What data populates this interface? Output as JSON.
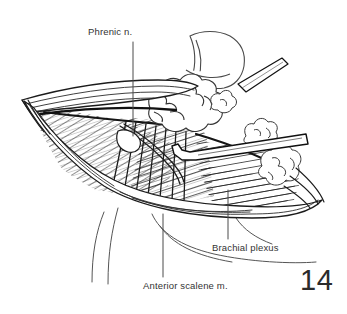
{
  "figure": {
    "number": "14",
    "kind": "anatomical-line-drawing",
    "background_color": "#ffffff",
    "ink_color": "#1b1b1b",
    "label_color": "#333333"
  },
  "labels": {
    "phrenic": "Phrenic n.",
    "brachial": "Brachial plexus",
    "scalene": "Anterior scalene m."
  },
  "leaders": {
    "phrenic": {
      "x1": 133,
      "y1": 42,
      "x2": 133,
      "y2": 136
    },
    "brachial": {
      "x1": 228,
      "y1": 190,
      "x2": 228,
      "y2": 239
    },
    "scalene": {
      "x1": 163,
      "y1": 214,
      "x2": 163,
      "y2": 277
    }
  },
  "structures": [
    {
      "name": "skin-flap-upper",
      "描述": "retracted upper skin and platysma flap"
    },
    {
      "name": "skin-flap-lower",
      "描述": "retracted lower skin flap over clavicle"
    },
    {
      "name": "anterior-scalene-muscle",
      "描述": "obliquely striated muscle belly filling the wound"
    },
    {
      "name": "fat-pad",
      "描述": "lobulated supraclavicular fat pad"
    },
    {
      "name": "brachial-plexus-trunks",
      "描述": "cord-like nerve trunks lateral to scalene"
    },
    {
      "name": "phrenic-nerve",
      "描述": "fine nerve crossing the scalene obliquely"
    },
    {
      "name": "retractor",
      "描述": "hooked surgical retractor entering from the right"
    },
    {
      "name": "neck-contour",
      "描述": "outline of neck and clavicle below the wound"
    }
  ]
}
